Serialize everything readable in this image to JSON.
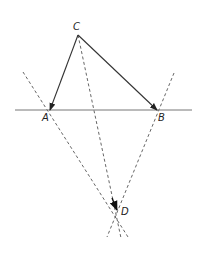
{
  "diagram": {
    "type": "geometric-construction",
    "colors": {
      "line": "#333333",
      "dashed": "#555555",
      "background": "#ffffff"
    },
    "points": [
      {
        "id": "C",
        "label": "C",
        "x": 78,
        "y": 35,
        "lx": 73,
        "ly": 30
      },
      {
        "id": "A",
        "label": "A",
        "x": 50,
        "y": 110,
        "lx": 42,
        "ly": 121
      },
      {
        "id": "B",
        "label": "B",
        "x": 157,
        "y": 110,
        "lx": 158,
        "ly": 121
      },
      {
        "id": "D",
        "label": "D",
        "x": 117,
        "y": 210,
        "lx": 121,
        "ly": 215
      }
    ],
    "solid_lines": [
      {
        "name": "baseline",
        "from": [
          15,
          110
        ],
        "to": [
          192,
          110
        ]
      }
    ],
    "arrows": [
      {
        "name": "arrow-C-to-A",
        "from": "C",
        "to": "A"
      },
      {
        "name": "arrow-C-to-B",
        "from": "C",
        "to": "B"
      }
    ],
    "dashed_lines": [
      {
        "name": "dashed-through-A",
        "from": [
          23,
          72
        ],
        "to": [
          128,
          237
        ]
      },
      {
        "name": "dashed-through-B",
        "from": [
          174,
          73
        ],
        "to": [
          107,
          237
        ]
      },
      {
        "name": "dashed-C-to-D",
        "from": [
          78,
          35
        ],
        "to": [
          121,
          238
        ]
      }
    ],
    "arrowhead_at_D": {
      "from": [
        112,
        198
      ],
      "to": [
        117,
        210
      ]
    }
  }
}
